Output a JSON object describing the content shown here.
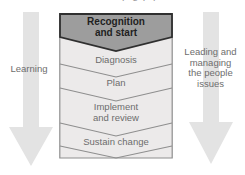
{
  "diagram": {
    "top_cropped_text": "p g p p",
    "colors": {
      "header_fill": "#9d9d9d",
      "header_border": "#2f2f2f",
      "body_fill": "#eceaea",
      "body_border": "#8e8e8e",
      "separator": "#8e8e8e",
      "arrow_fill": "#e3e3e3",
      "label_text": "#6d6d6d",
      "header_text": "#1f1f1f",
      "background": "#ffffff"
    },
    "funnel": {
      "name": "change-process-funnel",
      "stages": [
        {
          "id": "recognition-and-start",
          "label": "Recognition\nand start",
          "line1": "Recognition",
          "line2": "and start",
          "emphasis": true
        },
        {
          "id": "diagnosis",
          "label": "Diagnosis",
          "line1": "Diagnosis",
          "line2": "",
          "emphasis": false
        },
        {
          "id": "plan",
          "label": "Plan",
          "line1": "Plan",
          "line2": "",
          "emphasis": false
        },
        {
          "id": "implement-and-review",
          "label": "Implement and review",
          "line1": "Implement",
          "line2": "and review",
          "emphasis": false
        },
        {
          "id": "sustain-change",
          "label": "Sustain change",
          "line1": "Sustain change",
          "line2": "",
          "emphasis": false
        }
      ]
    },
    "left_arrow": {
      "name": "learning-arrow",
      "label": "Learning",
      "direction": "down",
      "icon": "down-arrow-icon"
    },
    "right_arrow": {
      "name": "leading-managing-arrow",
      "label": "Leading and managing the people issues",
      "line1": "Leading and",
      "line2": "managing",
      "line3": "the people",
      "line4": "issues",
      "direction": "down",
      "icon": "down-arrow-icon"
    }
  }
}
